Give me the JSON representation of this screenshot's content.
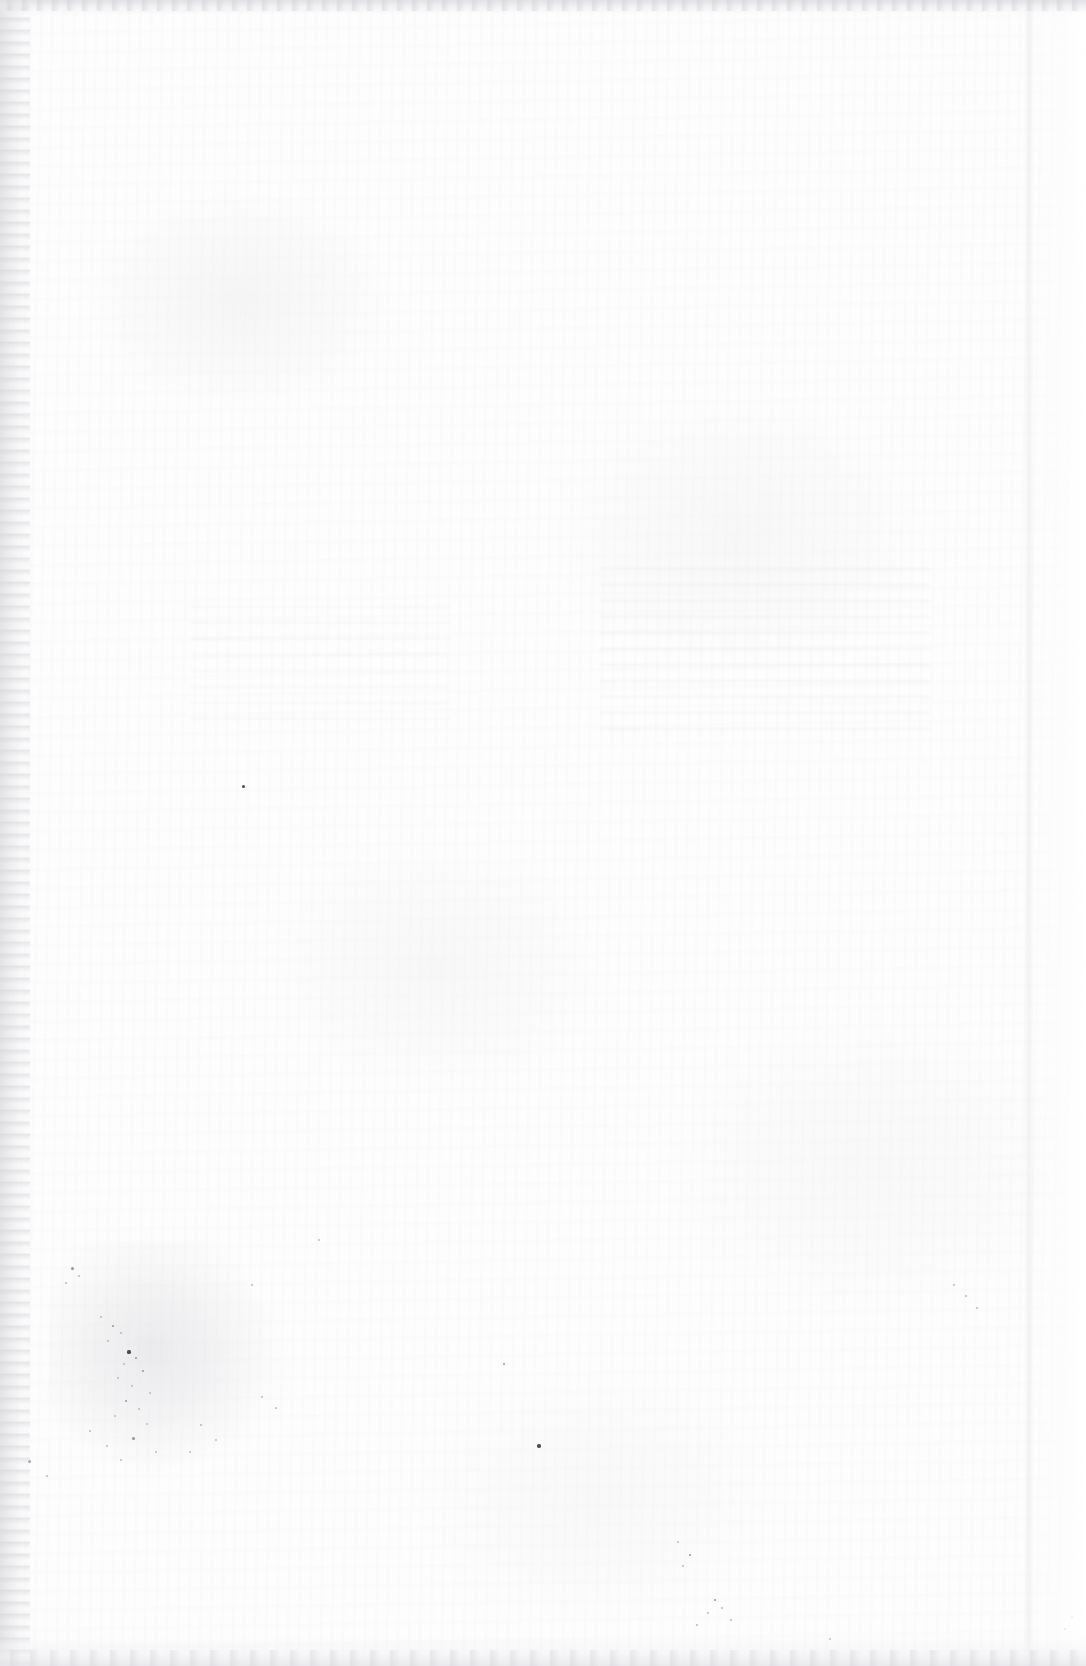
{
  "document": {
    "kind": "scanned-blank-page",
    "description": "Blank unprinted page from a scanned bound document",
    "page_text": "",
    "visible_text_count": 0,
    "page_number_label": "",
    "header_text": "",
    "footer_text": "",
    "caption": ""
  },
  "canvas": {
    "width": 1086,
    "height": 1666
  },
  "colors": {
    "paper": "#fdfdfd",
    "page_white": "#ffffff",
    "gutter_shadow": "#e2e2e5",
    "edge_band": "#dfdfe3",
    "speck_dark": "#4a4a50",
    "speck_mid": "#949499",
    "speck_faint": "#b8b8bd"
  },
  "features": {
    "left_gutter_label": "left binding gutter shadow",
    "right_edge_label": "right page edge highlight",
    "top_edge_label": "top edge scan band",
    "bottom_edge_label": "bottom edge scan band",
    "showthrough_label": "reverse-side show-through ghosting",
    "foxing_label": "foxing and dust speck cluster"
  },
  "specks": [
    {
      "x": 72,
      "y": 1268,
      "d": 3.0,
      "tone": "mid"
    },
    {
      "x": 79,
      "y": 1276,
      "d": 2.0,
      "tone": "faint"
    },
    {
      "x": 66,
      "y": 1283,
      "d": 2.4,
      "tone": "faint"
    },
    {
      "x": 101,
      "y": 1317,
      "d": 2.2,
      "tone": "faint"
    },
    {
      "x": 113,
      "y": 1326,
      "d": 2.8,
      "tone": "mid"
    },
    {
      "x": 121,
      "y": 1333,
      "d": 2.2,
      "tone": "faint"
    },
    {
      "x": 108,
      "y": 1341,
      "d": 2.0,
      "tone": "faint"
    },
    {
      "x": 129,
      "y": 1352,
      "d": 3.2,
      "tone": "dark"
    },
    {
      "x": 136,
      "y": 1358,
      "d": 2.2,
      "tone": "mid"
    },
    {
      "x": 124,
      "y": 1364,
      "d": 2.0,
      "tone": "faint"
    },
    {
      "x": 143,
      "y": 1371,
      "d": 2.6,
      "tone": "mid"
    },
    {
      "x": 118,
      "y": 1378,
      "d": 2.0,
      "tone": "faint"
    },
    {
      "x": 132,
      "y": 1386,
      "d": 2.4,
      "tone": "faint"
    },
    {
      "x": 150,
      "y": 1393,
      "d": 2.0,
      "tone": "faint"
    },
    {
      "x": 126,
      "y": 1401,
      "d": 2.8,
      "tone": "mid"
    },
    {
      "x": 139,
      "y": 1409,
      "d": 2.2,
      "tone": "faint"
    },
    {
      "x": 115,
      "y": 1416,
      "d": 2.0,
      "tone": "faint"
    },
    {
      "x": 147,
      "y": 1424,
      "d": 2.4,
      "tone": "faint"
    },
    {
      "x": 90,
      "y": 1431,
      "d": 2.2,
      "tone": "faint"
    },
    {
      "x": 133,
      "y": 1438,
      "d": 3.0,
      "tone": "mid"
    },
    {
      "x": 107,
      "y": 1446,
      "d": 2.0,
      "tone": "faint"
    },
    {
      "x": 156,
      "y": 1452,
      "d": 2.2,
      "tone": "faint"
    },
    {
      "x": 121,
      "y": 1460,
      "d": 2.6,
      "tone": "faint"
    },
    {
      "x": 29,
      "y": 1461,
      "d": 3.0,
      "tone": "mid"
    },
    {
      "x": 47,
      "y": 1476,
      "d": 2.2,
      "tone": "faint"
    },
    {
      "x": 201,
      "y": 1425,
      "d": 2.4,
      "tone": "faint"
    },
    {
      "x": 216,
      "y": 1440,
      "d": 2.0,
      "tone": "faint"
    },
    {
      "x": 190,
      "y": 1452,
      "d": 2.2,
      "tone": "faint"
    },
    {
      "x": 262,
      "y": 1397,
      "d": 2.2,
      "tone": "faint"
    },
    {
      "x": 276,
      "y": 1408,
      "d": 2.0,
      "tone": "faint"
    },
    {
      "x": 243,
      "y": 786,
      "d": 3.0,
      "tone": "dark"
    },
    {
      "x": 539,
      "y": 1446,
      "d": 3.4,
      "tone": "dark"
    },
    {
      "x": 504,
      "y": 1364,
      "d": 2.4,
      "tone": "mid"
    },
    {
      "x": 715,
      "y": 1600,
      "d": 2.6,
      "tone": "mid"
    },
    {
      "x": 722,
      "y": 1608,
      "d": 2.0,
      "tone": "faint"
    },
    {
      "x": 708,
      "y": 1613,
      "d": 2.2,
      "tone": "faint"
    },
    {
      "x": 731,
      "y": 1620,
      "d": 2.0,
      "tone": "faint"
    },
    {
      "x": 697,
      "y": 1625,
      "d": 2.4,
      "tone": "faint"
    },
    {
      "x": 830,
      "y": 1639,
      "d": 2.0,
      "tone": "faint"
    },
    {
      "x": 678,
      "y": 1542,
      "d": 2.2,
      "tone": "faint"
    },
    {
      "x": 690,
      "y": 1555,
      "d": 2.6,
      "tone": "mid"
    },
    {
      "x": 683,
      "y": 1566,
      "d": 2.0,
      "tone": "faint"
    },
    {
      "x": 954,
      "y": 1285,
      "d": 2.2,
      "tone": "faint"
    },
    {
      "x": 966,
      "y": 1296,
      "d": 2.0,
      "tone": "faint"
    },
    {
      "x": 977,
      "y": 1308,
      "d": 2.2,
      "tone": "faint"
    },
    {
      "x": 252,
      "y": 1285,
      "d": 2.0,
      "tone": "faint"
    },
    {
      "x": 319,
      "y": 1240,
      "d": 2.2,
      "tone": "faint"
    },
    {
      "x": 1065,
      "y": 1629,
      "d": 2.0,
      "tone": "faint"
    },
    {
      "x": 1072,
      "y": 1617,
      "d": 2.2,
      "tone": "faint"
    }
  ]
}
